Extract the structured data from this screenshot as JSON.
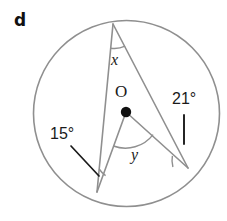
{
  "figure": {
    "part_label": "d",
    "background_color": "#ffffff",
    "stroke_color": "#8c8c8c",
    "accent_color": "#1a1a1a",
    "center_point_label": "O",
    "labels": {
      "angle_x": "x",
      "angle_y": "y",
      "angle_15": "15°",
      "angle_21": "21°"
    },
    "circle": {
      "center_x": 126.5,
      "center_y": 113.5,
      "radius": 93
    },
    "points": {
      "apex": {
        "x": 113,
        "y": 24
      },
      "bottom_left": {
        "x": 97,
        "y": 192
      },
      "right": {
        "x": 188,
        "y": 168
      },
      "center_dot": {
        "x": 126,
        "y": 112
      }
    },
    "segments": [
      {
        "name": "chord-apex-to-bottom-left",
        "x1": 113,
        "y1": 24,
        "x2": 97,
        "y2": 192
      },
      {
        "name": "chord-apex-to-right",
        "x1": 113,
        "y1": 24,
        "x2": 188,
        "y2": 168
      },
      {
        "name": "radius-center-to-bottom-left",
        "x1": 126,
        "y1": 112,
        "x2": 97,
        "y2": 192
      },
      {
        "name": "radius-center-to-right",
        "x1": 126,
        "y1": 112,
        "x2": 188,
        "y2": 168
      }
    ],
    "leader_lines": [
      {
        "name": "leader-15-degrees",
        "x1": 71,
        "y1": 146,
        "x2": 99,
        "y2": 176
      },
      {
        "name": "tick-21-degrees",
        "x1": 184,
        "y1": 115,
        "x2": 184,
        "y2": 144
      }
    ]
  }
}
